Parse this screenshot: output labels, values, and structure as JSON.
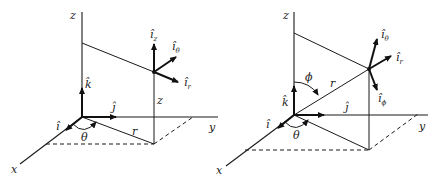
{
  "figure": {
    "cylindrical": {
      "axes": {
        "x": "x",
        "y": "y",
        "z": "z"
      },
      "cartesian_unit_vectors": {
        "i": "î",
        "j": "ĵ",
        "k": "k̂"
      },
      "labels": {
        "r": "r",
        "z": "z",
        "theta": "θ"
      },
      "unit_vectors": {
        "iz": {
          "base": "î",
          "sub": "z"
        },
        "itheta": {
          "base": "î",
          "sub": "θ"
        },
        "ir": {
          "base": "î",
          "sub": "r"
        }
      }
    },
    "spherical": {
      "axes": {
        "x": "x",
        "y": "y",
        "z": "z"
      },
      "cartesian_unit_vectors": {
        "i": "î",
        "j": "ĵ",
        "k": "k̂"
      },
      "labels": {
        "r": "r",
        "phi": "ϕ",
        "theta": "θ"
      },
      "unit_vectors": {
        "itheta": {
          "base": "î",
          "sub": "θ"
        },
        "ir": {
          "base": "î",
          "sub": "r"
        },
        "iphi": {
          "base": "î",
          "sub": "ϕ"
        }
      }
    }
  }
}
